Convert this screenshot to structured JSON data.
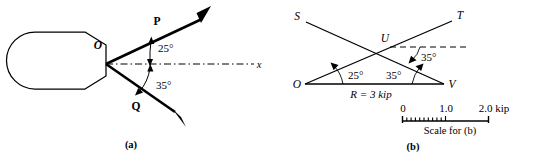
{
  "figure": {
    "panel_a": {
      "caption": "(a)",
      "origin_label": "O",
      "vector_p_label": "P",
      "vector_q_label": "Q",
      "axis_label": "x",
      "angle_p_label": "25°",
      "angle_q_label": "35°",
      "angle_p_value": 25,
      "angle_q_value": 35,
      "bracket_name": "hook-bracket-body"
    },
    "panel_b": {
      "caption": "(b)",
      "vertex_o_label": "O",
      "vertex_u_label": "U",
      "vertex_v_label": "V",
      "ray_s_label": "S",
      "ray_t_label": "T",
      "angle_o_label": "25°",
      "angle_v_label": "35°",
      "angle_u_label": "35°",
      "angle_o_value": 25,
      "angle_v_value": 35,
      "angle_u_value": 35,
      "resultant_label": "R = 3 kip",
      "scale": {
        "title": "Scale for (b)",
        "ticks": [
          "0",
          "1.0",
          "2.0 kip"
        ],
        "tick_values": [
          0,
          1.0,
          2.0
        ],
        "minor_divisions": 10,
        "minor_range": [
          0,
          1.0
        ]
      }
    },
    "colors": {
      "ink": "#000000",
      "background": "#ffffff"
    }
  }
}
